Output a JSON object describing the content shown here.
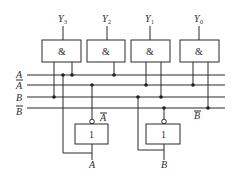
{
  "diagram": {
    "type": "logic-circuit-2-to-4-decoder",
    "outputs": [
      {
        "label": "Y",
        "sub": "3",
        "x": 63
      },
      {
        "label": "Y",
        "sub": "2",
        "x": 107
      },
      {
        "label": "Y",
        "sub": "1",
        "x": 150
      },
      {
        "label": "Y",
        "sub": "0",
        "x": 199
      }
    ],
    "and_gate_symbol": "&",
    "not_gate_symbol": "1",
    "bus_lines": [
      {
        "label": "A",
        "overbar": false,
        "y": 75
      },
      {
        "label": "A",
        "overbar": true,
        "y": 85
      },
      {
        "label": "B",
        "overbar": false,
        "y": 97
      },
      {
        "label": "B",
        "overbar": true,
        "y": 108
      }
    ],
    "inverters": [
      {
        "input_label": "A",
        "output_label": "A",
        "output_overbar": true
      },
      {
        "input_label": "B",
        "output_label": "B",
        "output_overbar": true
      }
    ]
  }
}
